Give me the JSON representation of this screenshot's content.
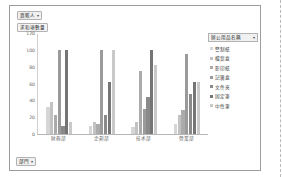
{
  "window": {
    "sheet_edge": "dashed-column-break"
  },
  "chart": {
    "legend_field_button": "買販人",
    "value_field_button": "求和項數量",
    "axis_field_button": "部門",
    "report_filter_button": "",
    "legend_title": "辦公用品名稱",
    "caret_glyph": "▾"
  },
  "chart_data": {
    "type": "bar",
    "title": "",
    "xlabel": "",
    "ylabel": "",
    "ylim": [
      0,
      120
    ],
    "yticks": [
      0,
      20,
      40,
      60,
      80,
      100,
      120
    ],
    "ytick_labels": [
      "0",
      "20",
      "40",
      "60",
      "80",
      "100",
      "120"
    ],
    "grid": false,
    "legend_position": "right",
    "categories": [
      "財務部",
      "企劃部",
      "技术部",
      "營業部"
    ],
    "series": [
      {
        "name": "警制紙",
        "color": "#d6d6d6",
        "values": [
          32,
          10,
          8,
          12
        ]
      },
      {
        "name": "檔案盒",
        "color": "#c2c2c2",
        "values": [
          38,
          14,
          14,
          22
        ]
      },
      {
        "name": "影印紙",
        "color": "#ababab",
        "values": [
          22,
          12,
          75,
          28
        ]
      },
      {
        "name": "記廣盒",
        "color": "#9a9a9a",
        "values": [
          100,
          100,
          30,
          95
        ]
      },
      {
        "name": "文件夾",
        "color": "#8a8a8a",
        "values": [
          10,
          22,
          44,
          48
        ]
      },
      {
        "name": "固定筆",
        "color": "#757575",
        "values": [
          100,
          62,
          100,
          62
        ]
      },
      {
        "name": "中性筆",
        "color": "#c9c9c9",
        "values": [
          14,
          100,
          82,
          62
        ]
      }
    ]
  }
}
